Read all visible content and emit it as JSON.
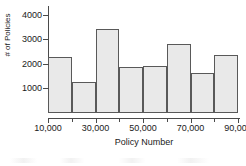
{
  "chart_data": {
    "type": "bar",
    "title": "",
    "xlabel": "Policy Number",
    "ylabel": "# of Policies",
    "categories": [
      "10,000-20,000",
      "20,000-30,000",
      "30,000-40,000",
      "40,000-50,000",
      "50,000-60,000",
      "60,000-70,000",
      "70,000-80,000",
      "80,000-90,000"
    ],
    "bin_edges": [
      10000,
      20000,
      30000,
      40000,
      50000,
      60000,
      70000,
      80000,
      90000
    ],
    "values": [
      2280,
      1250,
      3420,
      1880,
      1900,
      2820,
      1640,
      2350
    ],
    "xlim": [
      10000,
      90000
    ],
    "ylim": [
      0,
      4350
    ],
    "xticks": [
      10000,
      30000,
      50000,
      70000,
      90000
    ],
    "xtick_labels": [
      "10,000",
      "30,000",
      "50,000",
      "70,000",
      "90,000"
    ],
    "yticks": [
      1000,
      2000,
      3000,
      4000
    ],
    "ytick_labels": [
      "1000",
      "2000",
      "3000",
      "4000"
    ],
    "grid": false,
    "legend": false,
    "bar_fill_color": "#e9e9e9",
    "bar_edge_color": "#595959",
    "axis_color": "#4a4a4a",
    "text_color": "#1a1a1a"
  }
}
